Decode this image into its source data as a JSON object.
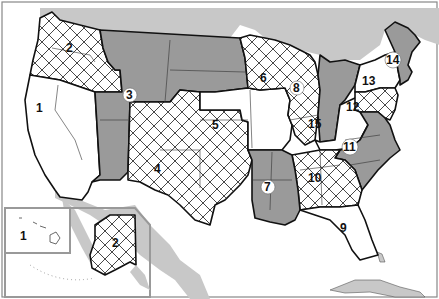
{
  "map": {
    "title": "United States regions map",
    "colors": {
      "background": "#ffffff",
      "land_foreign": "#c8c8c8",
      "region_dark": "#9a9a9a",
      "region_white": "#ffffff",
      "hatch": "#333333",
      "border": "#111111",
      "water": "#ffffff"
    },
    "legend_patterns": [
      "white",
      "crosshatch",
      "gray"
    ],
    "regions": [
      {
        "id": "1",
        "label": "1",
        "pattern": "white",
        "desc": "California / Nevada"
      },
      {
        "id": "2",
        "label": "2",
        "pattern": "crosshatch",
        "desc": "Washington / Oregon / Idaho"
      },
      {
        "id": "3",
        "label": "3",
        "pattern": "gray",
        "desc": "Montana / Wyoming / Utah / Arizona / Dakotas",
        "badge": true
      },
      {
        "id": "4",
        "label": "4",
        "pattern": "crosshatch",
        "desc": "Colorado / New Mexico / Texas / Oklahoma"
      },
      {
        "id": "5",
        "label": "5",
        "pattern": "white",
        "desc": "Nebraska / Kansas / Iowa / Missouri"
      },
      {
        "id": "6",
        "label": "6",
        "pattern": "crosshatch",
        "desc": "Minnesota / Wisconsin / Illinois"
      },
      {
        "id": "7",
        "label": "7",
        "pattern": "gray",
        "desc": "Arkansas / Louisiana / Mississippi",
        "badge": true
      },
      {
        "id": "8",
        "label": "8",
        "pattern": "gray",
        "desc": "Michigan / Indiana",
        "badge": true
      },
      {
        "id": "9",
        "label": "9",
        "pattern": "white",
        "desc": "Florida"
      },
      {
        "id": "10",
        "label": "10",
        "pattern": "crosshatch",
        "desc": "Tennessee / Alabama / Georgia"
      },
      {
        "id": "11",
        "label": "11",
        "pattern": "gray",
        "desc": "Virginia / West Virginia / Carolinas",
        "badge": true
      },
      {
        "id": "12",
        "label": "12",
        "pattern": "crosshatch",
        "desc": "Pennsylvania / New Jersey / Maryland / Delaware"
      },
      {
        "id": "13",
        "label": "13",
        "pattern": "white",
        "desc": "New York"
      },
      {
        "id": "14",
        "label": "14",
        "pattern": "gray",
        "desc": "New England",
        "badge": true
      },
      {
        "id": "15",
        "label": "15",
        "pattern": "white",
        "desc": "Ohio / Kentucky"
      }
    ],
    "insets": [
      {
        "id": "hawaii",
        "label": "1"
      },
      {
        "id": "alaska",
        "label": "2"
      }
    ]
  }
}
